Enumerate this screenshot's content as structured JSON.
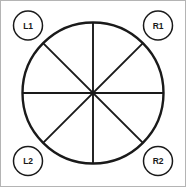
{
  "diagram": {
    "background_color": "#ffffff",
    "stroke_color": "#1a1a1a",
    "frame": {
      "border_color": "#b4b4b4",
      "border_width": 1,
      "width": 186,
      "height": 187
    },
    "main_circle": {
      "name": "main-circle",
      "center_x": 93,
      "center_y": 93,
      "radius": 70.5,
      "stroke_width": 2.4,
      "fill": "none"
    },
    "sector_count": 8,
    "divider_lines": [
      {
        "name": "divider-vertical",
        "angle_deg": 90,
        "x1": 93,
        "y1": 22.5,
        "x2": 93,
        "y2": 163.5
      },
      {
        "name": "divider-horizontal",
        "angle_deg": 0,
        "x1": 22.5,
        "y1": 93,
        "x2": 163.5,
        "y2": 93
      },
      {
        "name": "divider-diagonal-nwse",
        "angle_deg": 135,
        "x1": 43.1,
        "y1": 43.1,
        "x2": 142.9,
        "y2": 142.9
      },
      {
        "name": "divider-diagonal-nesw",
        "angle_deg": 45,
        "x1": 142.9,
        "y1": 43.1,
        "x2": 43.1,
        "y2": 142.9
      }
    ],
    "divider_stroke_width": 1.9,
    "nodes": [
      {
        "id": "L1",
        "label": "L1",
        "position": "top-left",
        "cx": 28,
        "cy": 25.5,
        "r": 14.5
      },
      {
        "id": "R1",
        "label": "R1",
        "position": "top-right",
        "cx": 158,
        "cy": 25.5,
        "r": 14.5
      },
      {
        "id": "L2",
        "label": "L2",
        "position": "bottom-left",
        "cx": 28,
        "cy": 161,
        "r": 14.5
      },
      {
        "id": "R2",
        "label": "R2",
        "position": "bottom-right",
        "cx": 158,
        "cy": 161,
        "r": 14.5
      }
    ],
    "node_stroke_width": 1.5,
    "node_fill": "#ffffff"
  }
}
